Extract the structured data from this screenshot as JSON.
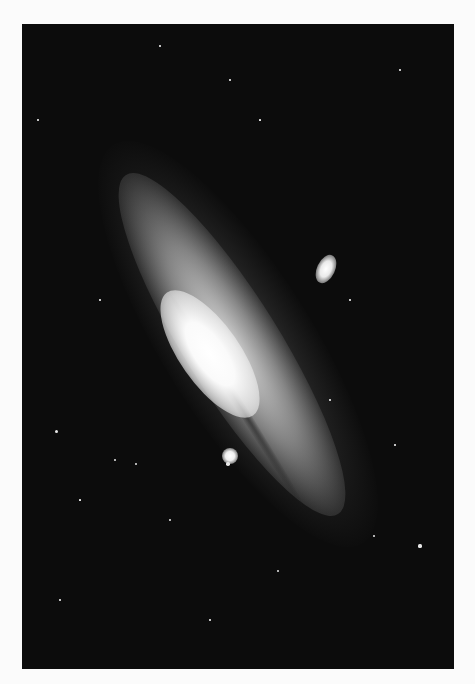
{
  "image": {
    "subject": "spiral galaxy with two satellite galaxies",
    "style": "black-and-white astronomical photograph",
    "background_color": "#0c0c0c",
    "page_color": "#fbfbfb"
  },
  "stars": [
    {
      "x": 56,
      "y": 431,
      "r": 1.5
    },
    {
      "x": 115,
      "y": 460,
      "r": 1.2
    },
    {
      "x": 228,
      "y": 464,
      "r": 1.8
    },
    {
      "x": 420,
      "y": 546,
      "r": 1.6
    },
    {
      "x": 278,
      "y": 571,
      "r": 1.2
    },
    {
      "x": 374,
      "y": 536,
      "r": 1
    },
    {
      "x": 136,
      "y": 464,
      "r": 1
    },
    {
      "x": 38,
      "y": 120,
      "r": 0.8
    },
    {
      "x": 400,
      "y": 70,
      "r": 0.8
    },
    {
      "x": 160,
      "y": 46,
      "r": 0.8
    },
    {
      "x": 330,
      "y": 400,
      "r": 0.8
    },
    {
      "x": 395,
      "y": 445,
      "r": 0.8
    },
    {
      "x": 60,
      "y": 600,
      "r": 0.8
    },
    {
      "x": 210,
      "y": 620,
      "r": 0.7
    },
    {
      "x": 350,
      "y": 300,
      "r": 0.7
    },
    {
      "x": 100,
      "y": 300,
      "r": 0.7
    },
    {
      "x": 230,
      "y": 80,
      "r": 0.7
    },
    {
      "x": 170,
      "y": 520,
      "r": 0.9
    },
    {
      "x": 260,
      "y": 120,
      "r": 0.6
    },
    {
      "x": 80,
      "y": 500,
      "r": 0.6
    }
  ]
}
